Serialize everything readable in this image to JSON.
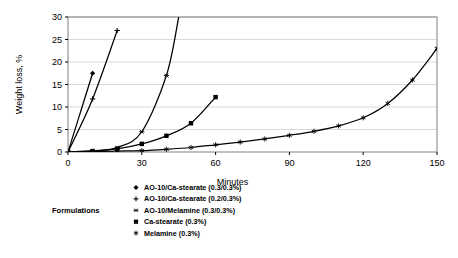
{
  "chart_data": {
    "type": "line",
    "title": "",
    "xlabel": "Minutes",
    "ylabel": "Weight loss, %",
    "xlim": [
      0,
      150
    ],
    "ylim": [
      0,
      30
    ],
    "xticks": [
      0,
      30,
      60,
      90,
      120,
      150
    ],
    "yticks": [
      0,
      5,
      10,
      15,
      20,
      25,
      30
    ],
    "xtick_labels": [
      "0",
      "30",
      "60",
      "90",
      "120",
      "150"
    ],
    "ytick_labels": [
      "0",
      "5",
      "10",
      "15",
      "20",
      "25",
      "30"
    ],
    "grid": "horizontal",
    "grid_color": "#d9d9d9",
    "line_color": "#000000",
    "plot_background": "#ffffff",
    "legend_position": "below-plot",
    "legend_group_label": "Formulations",
    "series": [
      {
        "name": "AO-10/Ca-stearate (0.3/0.3%)",
        "marker": "diamond",
        "x": [
          0,
          10
        ],
        "y": [
          0,
          17.5
        ]
      },
      {
        "name": "AO-10/Ca-stearate (0.2/0.3%)",
        "marker": "plus",
        "x": [
          0,
          10,
          20
        ],
        "y": [
          0,
          11.8,
          27.0
        ]
      },
      {
        "name": "AO-10/Melamine (0.3/0.3%)",
        "marker": "asterisk",
        "x": [
          0,
          10,
          20,
          30,
          40,
          45
        ],
        "y": [
          0,
          0.3,
          1.0,
          4.5,
          17.0,
          30.0
        ]
      },
      {
        "name": "Ca-stearate (0.3%)",
        "marker": "filled-square",
        "x": [
          0,
          10,
          20,
          30,
          40,
          50,
          60
        ],
        "y": [
          0,
          0.2,
          0.7,
          1.8,
          3.6,
          6.4,
          12.2
        ]
      },
      {
        "name": "Melamine (0.3%)",
        "marker": "star",
        "x": [
          0,
          10,
          20,
          30,
          40,
          50,
          60,
          70,
          80,
          90,
          100,
          110,
          120,
          130,
          140,
          150
        ],
        "y": [
          0,
          0.1,
          0.2,
          0.3,
          0.6,
          1.0,
          1.6,
          2.2,
          2.9,
          3.7,
          4.6,
          5.8,
          7.6,
          10.8,
          16.0,
          23.0
        ]
      }
    ]
  },
  "legend": {
    "group_label": "Formulations",
    "items": [
      {
        "label": "AO-10/Ca-stearate (0.3/0.3%)",
        "marker": "diamond"
      },
      {
        "label": "AO-10/Ca-stearate (0.2/0.3%)",
        "marker": "plus"
      },
      {
        "label": "AO-10/Melamine (0.3/0.3%)",
        "marker": "asterisk"
      },
      {
        "label": "Ca-stearate (0.3%)",
        "marker": "filled-square"
      },
      {
        "label": "Melamine (0.3%)",
        "marker": "star"
      }
    ]
  }
}
